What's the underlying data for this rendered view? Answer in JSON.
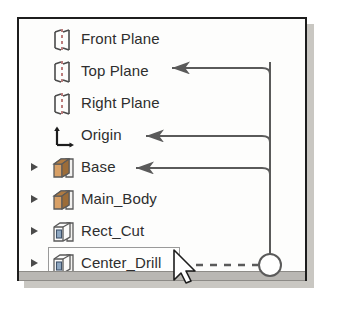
{
  "panel": {
    "name": "feature-manager-design-tree",
    "background_color": "#fdfdfc",
    "border_color": "#1d1d1d",
    "shadow_color": "#c9c7c2"
  },
  "tree": {
    "rows": [
      {
        "label": "Front Plane",
        "icon": "plane-icon",
        "has_twisty": false,
        "selected": false
      },
      {
        "label": "Top Plane",
        "icon": "plane-icon",
        "has_twisty": false,
        "selected": false
      },
      {
        "label": "Right Plane",
        "icon": "plane-icon",
        "has_twisty": false,
        "selected": false
      },
      {
        "label": "Origin",
        "icon": "origin-axis-icon",
        "has_twisty": false,
        "selected": false
      },
      {
        "label": "Base",
        "icon": "solid-boss-icon",
        "has_twisty": true,
        "selected": false
      },
      {
        "label": "Main_Body",
        "icon": "solid-boss-icon",
        "has_twisty": true,
        "selected": false
      },
      {
        "label": "Rect_Cut",
        "icon": "cut-feature-icon",
        "has_twisty": true,
        "selected": false
      },
      {
        "label": "Center_Drill",
        "icon": "cut-feature-icon",
        "has_twisty": true,
        "selected": true
      }
    ]
  },
  "annotations": {
    "callout_marker": "circle",
    "leader_style": "dashed",
    "targets": [
      "Top Plane",
      "Origin",
      "Base"
    ],
    "source_row": "Center_Drill",
    "line_color": "#5a5a5a"
  },
  "pointer": {
    "name": "mouse-cursor",
    "shape": "arrow"
  },
  "scrollbar": {
    "orientation": "horizontal",
    "track_color": "#b9b7b3"
  }
}
